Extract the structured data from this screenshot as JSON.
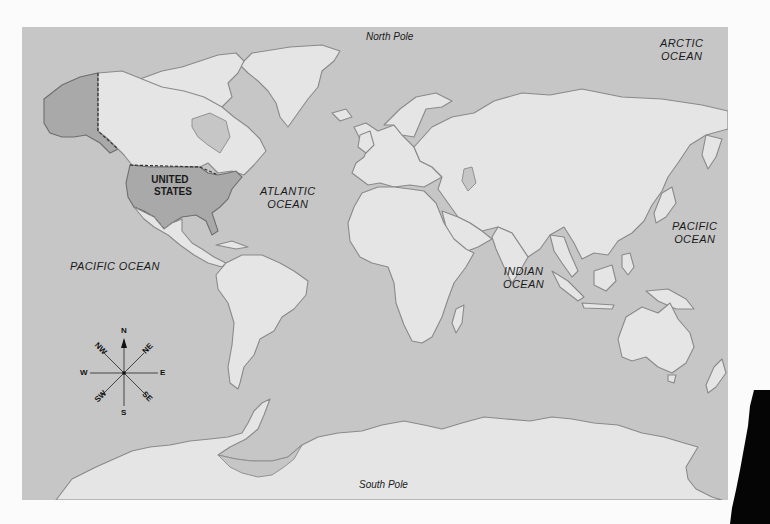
{
  "map": {
    "title": "World Map",
    "colors": {
      "ocean": "#c6c6c6",
      "land": "#e5e5e5",
      "highlight": "#a9a9a9",
      "coastline": "#8a8a8a",
      "paper": "#fbfbfb"
    },
    "highlighted_country": "United States"
  },
  "labels": {
    "north_pole": "North Pole",
    "south_pole": "South Pole",
    "arctic_ocean": [
      "ARCTIC",
      "OCEAN"
    ],
    "atlantic_ocean": [
      "ATLANTIC",
      "OCEAN"
    ],
    "pacific_ocean_east": [
      "PACIFIC",
      "OCEAN"
    ],
    "pacific_ocean_west": "PACIFIC OCEAN",
    "indian_ocean": [
      "INDIAN",
      "OCEAN"
    ],
    "united_states": [
      "UNITED",
      "STATES"
    ]
  },
  "compass": {
    "icon": "compass-rose-icon",
    "directions": {
      "n": "N",
      "ne": "NE",
      "e": "E",
      "se": "SE",
      "s": "S",
      "sw": "SW",
      "w": "W",
      "nw": "NW"
    }
  }
}
